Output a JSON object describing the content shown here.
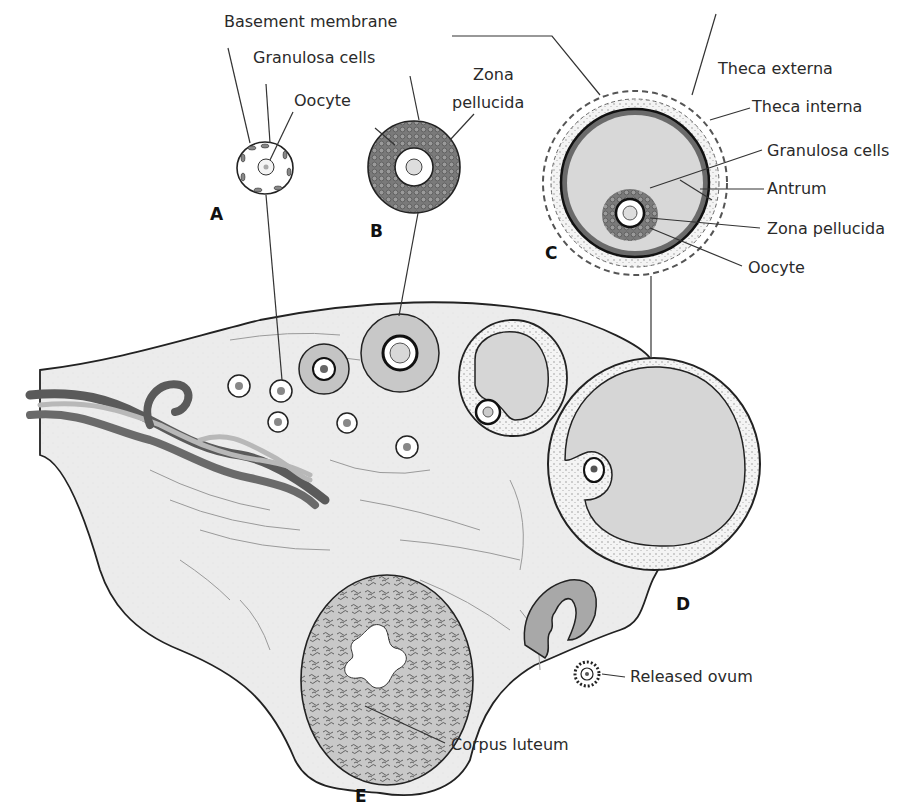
{
  "figure": {
    "colors": {
      "background": "#ffffff",
      "stroma": "#ececec",
      "antrum": "#d6d6d6",
      "granulosa": "#6e6e6e",
      "outline": "#222222",
      "vessel_dark": "#5a5a5a",
      "vessel_light": "#b8b8b8"
    }
  },
  "stages": {
    "a": "A",
    "b": "B",
    "c": "C",
    "d": "D",
    "e": "E"
  },
  "labels": {
    "basement_membrane": "Basement membrane",
    "granulosa_cells_a": "Granulosa cells",
    "oocyte_a": "Oocyte",
    "zona_line1": "Zona",
    "zona_line2": "pellucida",
    "theca_externa": "Theca externa",
    "theca_interna": "Theca interna",
    "granulosa_cells_c": "Granulosa cells",
    "antrum": "Antrum",
    "zona_pellucida_c": "Zona pellucida",
    "oocyte_c": "Oocyte",
    "released_ovum": "Released ovum",
    "corpus_luteum": "Corpus luteum"
  }
}
